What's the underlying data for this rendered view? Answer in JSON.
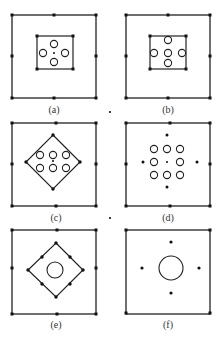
{
  "figure": {
    "width": 224,
    "height": 340,
    "stroke_color": "#222222",
    "background": "#ffffff",
    "stray_dots": [
      [
        110,
        112
      ],
      [
        110,
        218
      ]
    ],
    "panels": [
      {
        "id": "a",
        "label": "(a)",
        "frame": [
          12,
          15,
          84,
          83
        ],
        "frame_pins": [
          [
            12,
            15
          ],
          [
            54,
            15
          ],
          [
            96,
            15
          ],
          [
            12,
            56
          ],
          [
            96,
            56
          ],
          [
            12,
            98
          ],
          [
            54,
            98
          ],
          [
            96,
            98
          ]
        ],
        "inner_rect": [
          37,
          36,
          36,
          33
        ],
        "inner_rect_pins": [
          [
            37,
            36
          ],
          [
            73,
            36
          ],
          [
            37,
            69
          ],
          [
            73,
            69
          ]
        ],
        "polygon": null,
        "polygon_pins": [],
        "holes": [
          [
            54,
            44,
            3.6
          ],
          [
            43,
            53,
            3.6
          ],
          [
            65,
            53,
            3.6
          ],
          [
            54,
            62,
            3.6
          ]
        ],
        "dots": [
          [
            54,
            53,
            1
          ]
        ],
        "label_pos": [
          54,
          113
        ]
      },
      {
        "id": "b",
        "label": "(b)",
        "frame": [
          126,
          15,
          84,
          83
        ],
        "frame_pins": [
          [
            126,
            15
          ],
          [
            168,
            15
          ],
          [
            210,
            15
          ],
          [
            126,
            56
          ],
          [
            210,
            56
          ],
          [
            126,
            98
          ],
          [
            168,
            98
          ],
          [
            210,
            98
          ]
        ],
        "inner_rect": [
          150,
          36,
          36,
          33
        ],
        "inner_rect_pins": [
          [
            150,
            36
          ],
          [
            186,
            36
          ],
          [
            150,
            69
          ],
          [
            186,
            69
          ]
        ],
        "polygon": null,
        "polygon_pins": [],
        "holes": [
          [
            168,
            40,
            3.6
          ],
          [
            168,
            53,
            3.6
          ],
          [
            154,
            53,
            3.6
          ],
          [
            182,
            53,
            3.6
          ],
          [
            168,
            63,
            3.6
          ]
        ],
        "dots": [],
        "label_pos": [
          168,
          113
        ]
      },
      {
        "id": "c",
        "label": "(c)",
        "frame": [
          12,
          123,
          84,
          83
        ],
        "frame_pins": [
          [
            12,
            123
          ],
          [
            56,
            123
          ],
          [
            96,
            123
          ],
          [
            12,
            164
          ],
          [
            96,
            164
          ],
          [
            12,
            206
          ],
          [
            56,
            206
          ],
          [
            96,
            206
          ]
        ],
        "inner_rect": null,
        "inner_rect_pins": [],
        "polygon": [
          [
            53,
            135
          ],
          [
            80,
            162
          ],
          [
            53,
            189
          ],
          [
            26,
            162
          ]
        ],
        "polygon_pins": [
          [
            53,
            135
          ],
          [
            80,
            162
          ],
          [
            53,
            189
          ],
          [
            26,
            162
          ]
        ],
        "holes": [
          [
            40,
            155,
            3.6
          ],
          [
            53,
            155,
            3.6
          ],
          [
            66,
            155,
            3.6
          ],
          [
            40,
            168,
            3.6
          ],
          [
            53,
            168,
            3.6
          ],
          [
            66,
            168,
            3.6
          ]
        ],
        "dots": [
          [
            53,
            161,
            1
          ]
        ],
        "label_pos": [
          56,
          221
        ]
      },
      {
        "id": "d",
        "label": "(d)",
        "frame": [
          126,
          123,
          84,
          83
        ],
        "frame_pins": [
          [
            126,
            123
          ],
          [
            170,
            123
          ],
          [
            210,
            123
          ],
          [
            126,
            164
          ],
          [
            210,
            164
          ],
          [
            126,
            206
          ],
          [
            170,
            206
          ],
          [
            210,
            206
          ]
        ],
        "inner_rect": null,
        "inner_rect_pins": [],
        "polygon": null,
        "polygon_pins": [],
        "holes": [
          [
            154,
            149,
            3.6
          ],
          [
            167,
            149,
            3.6
          ],
          [
            180,
            149,
            3.6
          ],
          [
            154,
            162,
            3.6
          ],
          [
            180,
            162,
            3.6
          ],
          [
            154,
            175,
            3.6
          ],
          [
            167,
            175,
            3.6
          ],
          [
            180,
            175,
            3.6
          ]
        ],
        "dots": [
          [
            167,
            135,
            1.5
          ],
          [
            167,
            187,
            1.5
          ],
          [
            143,
            162,
            1.5
          ],
          [
            197,
            162,
            1.5
          ],
          [
            167,
            162,
            1
          ]
        ],
        "label_pos": [
          168,
          221
        ]
      },
      {
        "id": "e",
        "label": "(e)",
        "frame": [
          12,
          230,
          84,
          84
        ],
        "frame_pins": [
          [
            12,
            230
          ],
          [
            57,
            230
          ],
          [
            96,
            230
          ],
          [
            12,
            268
          ],
          [
            96,
            268
          ],
          [
            12,
            314
          ],
          [
            57,
            314
          ],
          [
            96,
            314
          ]
        ],
        "inner_rect": null,
        "inner_rect_pins": [],
        "polygon": [
          [
            56,
            243
          ],
          [
            83,
            270
          ],
          [
            56,
            297
          ],
          [
            28,
            270
          ]
        ],
        "polygon_pins": [
          [
            56,
            243
          ],
          [
            83,
            270
          ],
          [
            56,
            297
          ],
          [
            28,
            270
          ],
          [
            42,
            257
          ],
          [
            70,
            257
          ],
          [
            70,
            284
          ],
          [
            42,
            284
          ]
        ],
        "holes": [
          [
            55,
            270,
            8
          ]
        ],
        "dots": [],
        "label_pos": [
          56,
          328
        ]
      },
      {
        "id": "f",
        "label": "(f)",
        "frame": [
          126,
          230,
          84,
          84
        ],
        "frame_pins": [
          [
            126,
            230
          ],
          [
            210,
            230
          ],
          [
            126,
            313
          ],
          [
            210,
            313
          ]
        ],
        "inner_rect": null,
        "inner_rect_pins": [],
        "polygon": null,
        "polygon_pins": [],
        "holes": [
          [
            171,
            268,
            12
          ]
        ],
        "dots": [
          [
            171,
            242,
            1.6
          ],
          [
            171,
            293,
            1.6
          ],
          [
            142,
            268,
            1.6
          ],
          [
            199,
            268,
            1.6
          ]
        ],
        "label_pos": [
          168,
          328
        ]
      }
    ]
  }
}
